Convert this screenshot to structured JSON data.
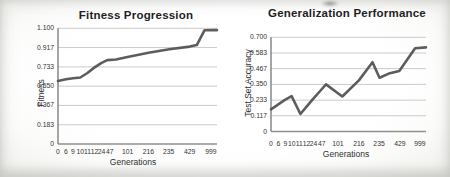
{
  "figure": {
    "line_color": "#4f4f4f",
    "grid_color": "#cacaca",
    "axis_color": "#8f8f8f"
  },
  "chart_data": [
    {
      "type": "line",
      "title": "Fitness Progression",
      "xlabel": "Generations",
      "ylabel": "Fitness",
      "ylim": [
        0,
        1.1
      ],
      "grid": true,
      "legend_position": "none",
      "x_tick_labels": [
        "0",
        "6",
        "9",
        "10",
        "11",
        "12",
        "24",
        "47",
        "101",
        "216",
        "235",
        "429",
        "999"
      ],
      "x_tick_pos": [
        0.0,
        0.049,
        0.094,
        0.14,
        0.185,
        0.229,
        0.274,
        0.325,
        0.438,
        0.569,
        0.696,
        0.828,
        0.962
      ],
      "y_tick_labels": [
        "0",
        "0.183",
        "0.367",
        "0.550",
        "0.733",
        "0.917",
        "1.100"
      ],
      "y_tick_values": [
        0,
        0.183,
        0.367,
        0.55,
        0.733,
        0.917,
        1.1
      ],
      "series": [
        {
          "name": "Fitness",
          "values_at_ticks": [
            0.6,
            0.615,
            0.627,
            0.632,
            0.675,
            0.728,
            0.772,
            0.8,
            0.83,
            0.87,
            0.9,
            0.93,
            1.08
          ]
        }
      ],
      "points": [
        [
          0.0,
          0.6
        ],
        [
          0.05,
          0.615
        ],
        [
          0.095,
          0.626
        ],
        [
          0.14,
          0.632
        ],
        [
          0.185,
          0.675
        ],
        [
          0.23,
          0.728
        ],
        [
          0.274,
          0.772
        ],
        [
          0.31,
          0.798
        ],
        [
          0.365,
          0.803
        ],
        [
          0.437,
          0.828
        ],
        [
          0.569,
          0.868
        ],
        [
          0.7,
          0.9
        ],
        [
          0.828,
          0.926
        ],
        [
          0.873,
          0.94
        ],
        [
          0.922,
          1.082
        ],
        [
          1.0,
          1.083
        ]
      ]
    },
    {
      "type": "line",
      "title": "Generalization Performance",
      "xlabel": "Generations",
      "ylabel": "Test Set Accuracy",
      "ylim": [
        0,
        0.7
      ],
      "grid": true,
      "legend_position": "none",
      "x_tick_labels": [
        "0",
        "6",
        "9",
        "10",
        "11",
        "12",
        "24",
        "47",
        "101",
        "216",
        "235",
        "429",
        "999"
      ],
      "x_tick_pos": [
        0.0,
        0.047,
        0.093,
        0.134,
        0.183,
        0.229,
        0.274,
        0.327,
        0.431,
        0.567,
        0.697,
        0.831,
        0.961
      ],
      "y_tick_labels": [
        "0",
        "0.117",
        "0.233",
        "0.350",
        "0.467",
        "0.583",
        "0.700"
      ],
      "y_tick_values": [
        0,
        0.117,
        0.233,
        0.35,
        0.467,
        0.583,
        0.7
      ],
      "series": [
        {
          "name": "Test Set Accuracy",
          "values_at_ticks": [
            0.165,
            0.2,
            0.235,
            0.262,
            0.13,
            0.185,
            0.24,
            0.305,
            0.26,
            0.38,
            0.4,
            0.45,
            0.62
          ]
        }
      ],
      "points": [
        [
          0.0,
          0.165
        ],
        [
          0.045,
          0.2
        ],
        [
          0.09,
          0.235
        ],
        [
          0.133,
          0.262
        ],
        [
          0.19,
          0.13
        ],
        [
          0.23,
          0.185
        ],
        [
          0.27,
          0.24
        ],
        [
          0.32,
          0.305
        ],
        [
          0.355,
          0.35
        ],
        [
          0.46,
          0.26
        ],
        [
          0.567,
          0.38
        ],
        [
          0.655,
          0.515
        ],
        [
          0.7,
          0.4
        ],
        [
          0.76,
          0.43
        ],
        [
          0.828,
          0.45
        ],
        [
          0.93,
          0.618
        ],
        [
          1.0,
          0.625
        ]
      ]
    }
  ]
}
